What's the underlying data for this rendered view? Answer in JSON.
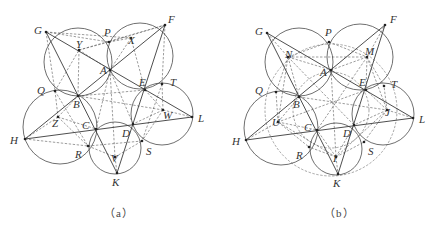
{
  "figure": {
    "panels": [
      {
        "id": "a",
        "caption": "（a）",
        "caption_pos": [
          104,
          204
        ],
        "points": {
          "G": [
            46,
            32
          ],
          "P": [
            109,
            42
          ],
          "F": [
            165,
            25
          ],
          "A": [
            110,
            70
          ],
          "Y": [
            79,
            50
          ],
          "X": [
            131,
            38
          ],
          "Q": [
            55,
            91
          ],
          "B": [
            78,
            96
          ],
          "E": [
            145,
            90
          ],
          "T": [
            162,
            84
          ],
          "H": [
            25,
            139
          ],
          "C": [
            96,
            129
          ],
          "D": [
            133,
            124
          ],
          "L": [
            192,
            117
          ],
          "Z": [
            58,
            117
          ],
          "W": [
            163,
            110
          ],
          "R": [
            88,
            146
          ],
          "S": [
            142,
            141
          ],
          "V": [
            115,
            157
          ],
          "K": [
            117,
            173
          ]
        },
        "labels": [
          {
            "t": "G",
            "x": 34,
            "y": 34
          },
          {
            "t": "P",
            "x": 104,
            "y": 36
          },
          {
            "t": "F",
            "x": 168,
            "y": 23
          },
          {
            "t": "Y",
            "x": 76,
            "y": 48
          },
          {
            "t": "X",
            "x": 128,
            "y": 44
          },
          {
            "t": "A",
            "x": 100,
            "y": 74
          },
          {
            "t": "Q",
            "x": 37,
            "y": 94
          },
          {
            "t": "B",
            "x": 73,
            "y": 108
          },
          {
            "t": "E",
            "x": 139,
            "y": 86
          },
          {
            "t": "T",
            "x": 170,
            "y": 86
          },
          {
            "t": "H",
            "x": 10,
            "y": 144
          },
          {
            "t": "Z",
            "x": 52,
            "y": 127
          },
          {
            "t": "C",
            "x": 82,
            "y": 129
          },
          {
            "t": "D",
            "x": 122,
            "y": 137
          },
          {
            "t": "W",
            "x": 163,
            "y": 119
          },
          {
            "t": "L",
            "x": 198,
            "y": 122
          },
          {
            "t": "R",
            "x": 75,
            "y": 158
          },
          {
            "t": "S",
            "x": 146,
            "y": 155
          },
          {
            "t": "V",
            "x": 111,
            "y": 162
          },
          {
            "t": "K",
            "x": 112,
            "y": 186
          }
        ],
        "solid_lines": [
          [
            "G",
            "L"
          ],
          [
            "F",
            "H"
          ],
          [
            "H",
            "L"
          ],
          [
            "K",
            "G"
          ],
          [
            "K",
            "F"
          ]
        ],
        "circles": [
          {
            "cx": 78,
            "cy": 62,
            "r": 34
          },
          {
            "cx": 140,
            "cy": 56,
            "r": 33
          },
          {
            "cx": 162,
            "cy": 114,
            "r": 31
          },
          {
            "cx": 115,
            "cy": 148,
            "r": 26
          },
          {
            "cx": 60,
            "cy": 127,
            "r": 37
          }
        ],
        "dashed_circles": [],
        "dashed_lines": [
          [
            "G",
            "P"
          ],
          [
            "P",
            "F"
          ],
          [
            "G",
            "X"
          ],
          [
            "Y",
            "F"
          ],
          [
            "Y",
            "P"
          ],
          [
            "X",
            "P"
          ],
          [
            "G",
            "Q"
          ],
          [
            "Q",
            "Y"
          ],
          [
            "Y",
            "B"
          ],
          [
            "X",
            "E"
          ],
          [
            "X",
            "A"
          ],
          [
            "F",
            "T"
          ],
          [
            "T",
            "W"
          ],
          [
            "E",
            "W"
          ],
          [
            "Q",
            "Z"
          ],
          [
            "Z",
            "H"
          ],
          [
            "Z",
            "R"
          ],
          [
            "Z",
            "B"
          ],
          [
            "B",
            "E"
          ],
          [
            "B",
            "W"
          ],
          [
            "W",
            "L"
          ],
          [
            "W",
            "S"
          ],
          [
            "H",
            "R"
          ],
          [
            "R",
            "S"
          ],
          [
            "R",
            "V"
          ],
          [
            "V",
            "K"
          ],
          [
            "V",
            "S"
          ],
          [
            "Y",
            "A"
          ],
          [
            "A",
            "V"
          ],
          [
            "Q",
            "R"
          ],
          [
            "T",
            "S"
          ],
          [
            "Z",
            "C"
          ],
          [
            "W",
            "D"
          ],
          [
            "A",
            "C"
          ],
          [
            "A",
            "D"
          ]
        ]
      },
      {
        "id": "b",
        "caption": "（b）",
        "caption_pos": [
          324,
          204
        ],
        "points": {
          "G": [
            267,
            33
          ],
          "P": [
            329,
            42
          ],
          "F": [
            385,
            25
          ],
          "A": [
            331,
            70
          ],
          "N": [
            288,
            57
          ],
          "M": [
            367,
            57
          ],
          "Q": [
            276,
            92
          ],
          "B": [
            299,
            97
          ],
          "E": [
            366,
            90
          ],
          "T": [
            384,
            86
          ],
          "H": [
            246,
            140
          ],
          "C": [
            317,
            130
          ],
          "D": [
            354,
            125
          ],
          "L": [
            413,
            118
          ],
          "U": [
            278,
            122
          ],
          "J": [
            387,
            110
          ],
          "R": [
            309,
            147
          ],
          "S": [
            364,
            142
          ],
          "I": [
            336,
            157
          ],
          "K": [
            338,
            174
          ]
        },
        "labels": [
          {
            "t": "G",
            "x": 255,
            "y": 35
          },
          {
            "t": "P",
            "x": 325,
            "y": 36
          },
          {
            "t": "F",
            "x": 390,
            "y": 23
          },
          {
            "t": "N",
            "x": 285,
            "y": 58
          },
          {
            "t": "M",
            "x": 365,
            "y": 55
          },
          {
            "t": "A",
            "x": 320,
            "y": 76
          },
          {
            "t": "Q",
            "x": 255,
            "y": 94
          },
          {
            "t": "B",
            "x": 293,
            "y": 108
          },
          {
            "t": "E",
            "x": 359,
            "y": 86
          },
          {
            "t": "T",
            "x": 391,
            "y": 88
          },
          {
            "t": "H",
            "x": 232,
            "y": 145
          },
          {
            "t": "U",
            "x": 272,
            "y": 126
          },
          {
            "t": "C",
            "x": 304,
            "y": 131
          },
          {
            "t": "D",
            "x": 343,
            "y": 137
          },
          {
            "t": "J",
            "x": 385,
            "y": 116
          },
          {
            "t": "L",
            "x": 419,
            "y": 123
          },
          {
            "t": "R",
            "x": 296,
            "y": 159
          },
          {
            "t": "S",
            "x": 368,
            "y": 155
          },
          {
            "t": "I",
            "x": 333,
            "y": 162
          },
          {
            "t": "K",
            "x": 333,
            "y": 187
          }
        ],
        "solid_lines": [
          [
            "G",
            "L"
          ],
          [
            "F",
            "H"
          ],
          [
            "H",
            "L"
          ],
          [
            "K",
            "G"
          ],
          [
            "K",
            "F"
          ]
        ],
        "circles": [
          {
            "cx": 299,
            "cy": 62,
            "r": 34
          },
          {
            "cx": 360,
            "cy": 57,
            "r": 33
          },
          {
            "cx": 383,
            "cy": 114,
            "r": 31
          },
          {
            "cx": 336,
            "cy": 149,
            "r": 26
          },
          {
            "cx": 281,
            "cy": 128,
            "r": 37
          }
        ],
        "dashed_circles": [
          {
            "cx": 331,
            "cy": 110,
            "r": 66
          },
          {
            "cx": 331,
            "cy": 110,
            "r": 38
          }
        ],
        "dashed_lines": [
          [
            "G",
            "N"
          ],
          [
            "N",
            "A"
          ],
          [
            "N",
            "B"
          ],
          [
            "N",
            "Q"
          ],
          [
            "N",
            "P"
          ],
          [
            "P",
            "M"
          ],
          [
            "M",
            "F"
          ],
          [
            "M",
            "E"
          ],
          [
            "M",
            "A"
          ],
          [
            "M",
            "T"
          ],
          [
            "Q",
            "U"
          ],
          [
            "U",
            "H"
          ],
          [
            "U",
            "B"
          ],
          [
            "U",
            "R"
          ],
          [
            "U",
            "C"
          ],
          [
            "J",
            "L"
          ],
          [
            "J",
            "E"
          ],
          [
            "J",
            "T"
          ],
          [
            "J",
            "S"
          ],
          [
            "J",
            "D"
          ],
          [
            "I",
            "K"
          ],
          [
            "I",
            "R"
          ],
          [
            "I",
            "S"
          ],
          [
            "I",
            "C"
          ],
          [
            "I",
            "D"
          ],
          [
            "N",
            "M"
          ],
          [
            "M",
            "J"
          ],
          [
            "J",
            "I"
          ],
          [
            "I",
            "U"
          ],
          [
            "U",
            "N"
          ],
          [
            "A",
            "I"
          ],
          [
            "B",
            "J"
          ],
          [
            "E",
            "U"
          ],
          [
            "N",
            "D"
          ],
          [
            "M",
            "C"
          ]
        ]
      }
    ]
  }
}
